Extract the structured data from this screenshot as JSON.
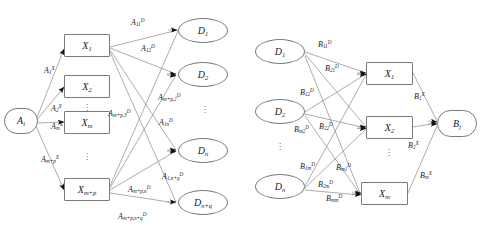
{
  "figure": {
    "title": "",
    "panels": [
      {
        "id": "left-panel",
        "name": "forward-mapping-network",
        "source_node": {
          "id": "A_i",
          "base": "A",
          "sub": "i",
          "sup": "",
          "shape": "stadium"
        },
        "hidden_nodes": [
          {
            "id": "X_1",
            "base": "X",
            "sub": "1",
            "shape": "rect"
          },
          {
            "id": "X_2",
            "base": "X",
            "sub": "2",
            "shape": "rect"
          },
          {
            "id": "X_m",
            "base": "X",
            "sub": "m",
            "shape": "rect"
          },
          {
            "id": "X_m+p",
            "base": "X",
            "sub": "m+p",
            "shape": "rect"
          }
        ],
        "output_nodes": [
          {
            "id": "D_1",
            "base": "D",
            "sub": "1",
            "shape": "ellipse"
          },
          {
            "id": "D_2",
            "base": "D",
            "sub": "2",
            "shape": "ellipse"
          },
          {
            "id": "D_n",
            "base": "D",
            "sub": "n",
            "shape": "ellipse"
          },
          {
            "id": "D_n+q",
            "base": "D",
            "sub": "n+q",
            "shape": "ellipse"
          }
        ],
        "input_weight_labels": [
          {
            "base": "A",
            "sub": "1",
            "sup": "X"
          },
          {
            "base": "A",
            "sub": "2",
            "sup": "X"
          },
          {
            "base": "A",
            "sub": "m",
            "sup": "X"
          },
          {
            "base": "A",
            "sub": "m+p",
            "sup": "X"
          }
        ],
        "output_weight_labels": [
          {
            "base": "A",
            "sub": "11",
            "sup": "D"
          },
          {
            "base": "A",
            "sub": "12",
            "sup": "D"
          },
          {
            "base": "A",
            "sub": "m+p,3",
            "sup": "D"
          },
          {
            "base": "A",
            "sub": "m+p,2",
            "sup": "D"
          },
          {
            "base": "A",
            "sub": "1n",
            "sup": "D"
          },
          {
            "base": "A",
            "sub": "m+p,n",
            "sup": "D"
          },
          {
            "base": "A",
            "sub": "1,n+q",
            "sup": "D"
          },
          {
            "base": "A",
            "sub": "m+p,n+q",
            "sup": "D"
          }
        ],
        "ellipsis_marks": 4
      },
      {
        "id": "right-panel",
        "name": "inverse-mapping-network",
        "input_nodes": [
          {
            "id": "D_1",
            "base": "D",
            "sub": "1",
            "shape": "ellipse"
          },
          {
            "id": "D_2",
            "base": "D",
            "sub": "2",
            "shape": "ellipse"
          },
          {
            "id": "D_n",
            "base": "D",
            "sub": "n",
            "shape": "ellipse"
          }
        ],
        "hidden_nodes": [
          {
            "id": "X_1",
            "base": "X",
            "sub": "1",
            "shape": "rect"
          },
          {
            "id": "X_2",
            "base": "X",
            "sub": "2",
            "shape": "rect"
          },
          {
            "id": "X_m",
            "base": "X",
            "sub": "m",
            "shape": "rect"
          }
        ],
        "output_node": {
          "id": "B_j",
          "base": "B",
          "sub": "j",
          "sup": "",
          "shape": "stadium"
        },
        "input_weight_labels": [
          {
            "base": "B",
            "sub": "11",
            "sup": "D"
          },
          {
            "base": "B",
            "sub": "21",
            "sup": "D"
          },
          {
            "base": "B",
            "sub": "12",
            "sup": "D"
          },
          {
            "base": "B",
            "sub": "m2",
            "sup": "D"
          },
          {
            "base": "B",
            "sub": "22",
            "sup": "D"
          },
          {
            "base": "B",
            "sub": "1m",
            "sup": "D"
          },
          {
            "base": "B",
            "sub": "m1",
            "sup": "D"
          },
          {
            "base": "B",
            "sub": "2m",
            "sup": "D"
          },
          {
            "base": "B",
            "sub": "mm",
            "sup": "D"
          }
        ],
        "output_weight_labels": [
          {
            "base": "B",
            "sub": "1",
            "sup": "X"
          },
          {
            "base": "B",
            "sub": "2",
            "sup": "X"
          },
          {
            "base": "B",
            "sub": "m",
            "sup": "X"
          }
        ],
        "ellipsis_marks": 2
      }
    ],
    "colors": {
      "stroke": "#7a7a7a",
      "text": "#1a1a1a",
      "background": "#ffffff",
      "arrowhead": "#111111"
    }
  }
}
